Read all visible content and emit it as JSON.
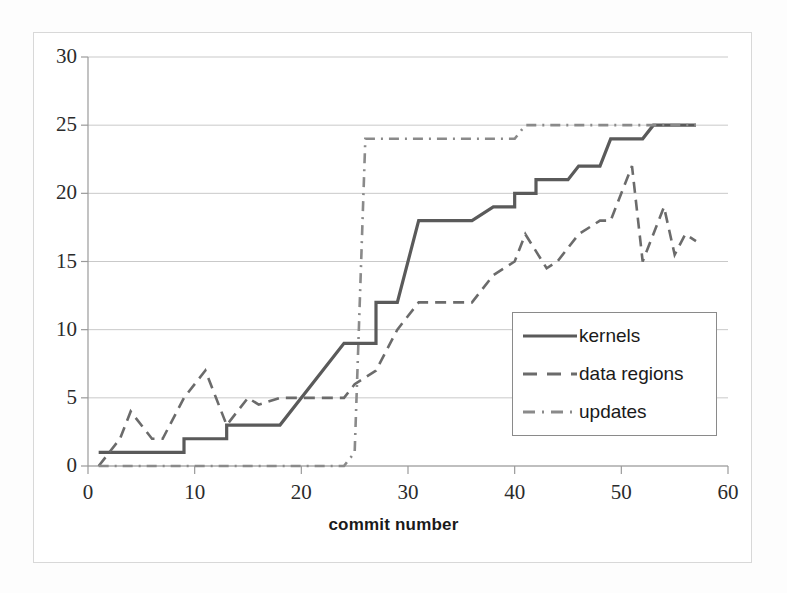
{
  "chart_data": {
    "type": "line",
    "title": "",
    "xlabel": "commit number",
    "ylabel": "",
    "xlim": [
      0,
      60
    ],
    "ylim": [
      0,
      30
    ],
    "xticks": [
      "0",
      "10",
      "20",
      "30",
      "40",
      "50",
      "60"
    ],
    "yticks": [
      "0",
      "5",
      "10",
      "15",
      "20",
      "25",
      "30"
    ],
    "grid": "horizontal",
    "legend_position": "center-right",
    "series": [
      {
        "name": "kernels",
        "style": "solid",
        "color": "#5a5a5a",
        "points": [
          [
            1,
            1
          ],
          [
            9,
            1
          ],
          [
            9,
            2
          ],
          [
            13,
            2
          ],
          [
            13,
            3
          ],
          [
            18,
            3
          ],
          [
            24,
            9
          ],
          [
            27,
            9
          ],
          [
            27,
            12
          ],
          [
            29,
            12
          ],
          [
            31,
            18
          ],
          [
            36,
            18
          ],
          [
            38,
            19
          ],
          [
            40,
            19
          ],
          [
            40,
            20
          ],
          [
            42,
            20
          ],
          [
            42,
            21
          ],
          [
            45,
            21
          ],
          [
            46,
            22
          ],
          [
            48,
            22
          ],
          [
            49,
            24
          ],
          [
            52,
            24
          ],
          [
            53,
            25
          ],
          [
            57,
            25
          ]
        ]
      },
      {
        "name": "data regions",
        "style": "dashed",
        "color": "#6b6b6b",
        "points": [
          [
            1,
            0
          ],
          [
            3,
            2
          ],
          [
            4,
            4
          ],
          [
            6,
            2
          ],
          [
            7,
            2
          ],
          [
            9,
            5
          ],
          [
            11,
            7
          ],
          [
            12,
            5
          ],
          [
            13,
            3
          ],
          [
            15,
            5
          ],
          [
            16,
            4.5
          ],
          [
            18,
            5
          ],
          [
            24,
            5
          ],
          [
            25,
            6
          ],
          [
            27,
            7
          ],
          [
            29,
            10
          ],
          [
            31,
            12
          ],
          [
            33,
            12
          ],
          [
            36,
            12
          ],
          [
            38,
            14
          ],
          [
            40,
            15
          ],
          [
            41,
            17
          ],
          [
            43,
            14.5
          ],
          [
            44,
            15
          ],
          [
            45,
            16
          ],
          [
            46,
            17
          ],
          [
            48,
            18
          ],
          [
            49,
            18
          ],
          [
            50,
            20
          ],
          [
            51,
            22
          ],
          [
            52,
            15
          ],
          [
            53,
            17
          ],
          [
            54,
            19
          ],
          [
            55,
            15.5
          ],
          [
            56,
            17
          ],
          [
            57,
            16.5
          ]
        ]
      },
      {
        "name": "updates",
        "style": "dashdot",
        "color": "#8a8a8a",
        "points": [
          [
            1,
            0
          ],
          [
            24,
            0
          ],
          [
            25,
            1
          ],
          [
            26,
            24
          ],
          [
            27,
            24
          ],
          [
            40,
            24
          ],
          [
            41,
            25
          ],
          [
            57,
            25
          ]
        ]
      }
    ]
  },
  "axis_labels": {
    "x": [
      "0",
      "10",
      "20",
      "30",
      "40",
      "50",
      "60"
    ],
    "y": [
      "30",
      "25",
      "20",
      "15",
      "10",
      "5",
      "0"
    ]
  },
  "legend": {
    "items": [
      {
        "label": "kernels",
        "style": "solid"
      },
      {
        "label": "data regions",
        "style": "dashed"
      },
      {
        "label": "updates",
        "style": "dashdot"
      }
    ]
  },
  "xlabel_text": "commit number",
  "colors": {
    "kernels": "#5a5a5a",
    "data_regions": "#6b6b6b",
    "updates": "#8a8a8a",
    "grid": "#c9c9c9",
    "axis": "#9a9a9a",
    "frame": "#d8d8d8",
    "text": "#231f20"
  }
}
